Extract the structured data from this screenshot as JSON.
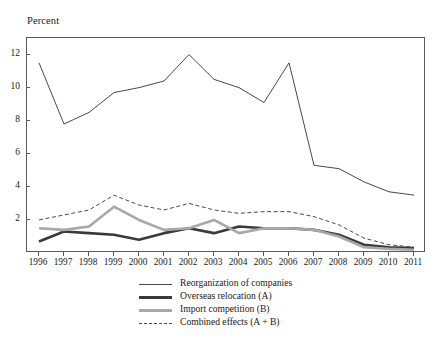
{
  "figure": {
    "cut_off_top_text": "",
    "axis_title": "Percent"
  },
  "chart_data": {
    "type": "line",
    "title": "",
    "subtitle": "",
    "xlabel": "",
    "ylabel": "Percent",
    "xlim": [
      1996,
      2011
    ],
    "ylim": [
      0,
      13
    ],
    "yticks": [
      2,
      4,
      6,
      8,
      10,
      12
    ],
    "grid": false,
    "legend_position": "bottom",
    "categories": [
      1996,
      1997,
      1998,
      1999,
      2000,
      2001,
      2002,
      2003,
      2004,
      2005,
      2006,
      2007,
      2008,
      2009,
      2010,
      2011
    ],
    "tick_labels": [
      "1996",
      "1997",
      "1998",
      "1999",
      "2000",
      "2001",
      "2002",
      "2003",
      "2004",
      "2005",
      "2006",
      "2007",
      "2008",
      "2009",
      "2010",
      "2011"
    ],
    "series": [
      {
        "name": "Reorganization of companies",
        "style": "solid-thin",
        "color": "#4a4a4a",
        "width": 1.0,
        "values": [
          11.5,
          7.8,
          8.5,
          9.7,
          10.0,
          10.4,
          12.0,
          10.5,
          10.0,
          9.1,
          11.5,
          5.3,
          5.1,
          4.3,
          3.7,
          3.5
        ]
      },
      {
        "name": "Overseas relocation (A)",
        "style": "solid-thick",
        "color": "#3a3a3a",
        "width": 2.6,
        "values": [
          0.7,
          1.3,
          1.2,
          1.1,
          0.8,
          1.2,
          1.5,
          1.2,
          1.6,
          1.5,
          1.5,
          1.4,
          1.1,
          0.5,
          0.35,
          0.3
        ]
      },
      {
        "name": "Import competition (B)",
        "style": "solid-thick",
        "color": "#a8a8a8",
        "width": 2.6,
        "values": [
          1.5,
          1.4,
          1.6,
          2.8,
          2.0,
          1.4,
          1.5,
          2.0,
          1.2,
          1.5,
          1.5,
          1.4,
          1.0,
          0.35,
          0.25,
          0.2
        ]
      },
      {
        "name": "Combined effects (A + B)",
        "style": "dashed",
        "color": "#4a4a4a",
        "width": 1.0,
        "values": [
          2.0,
          2.3,
          2.6,
          3.5,
          2.9,
          2.6,
          3.0,
          2.6,
          2.4,
          2.5,
          2.5,
          2.2,
          1.7,
          0.9,
          0.5,
          0.35
        ]
      }
    ]
  },
  "legend": {
    "items": [
      {
        "label": "Reorganization of companies",
        "marker": "solid-thin-line"
      },
      {
        "label": "Overseas relocation (A)",
        "marker": "solid-thick-dark-line"
      },
      {
        "label": "Import competition (B)",
        "marker": "solid-thick-gray-line"
      },
      {
        "label": "Combined effects (A + B)",
        "marker": "dashed-line"
      }
    ]
  }
}
